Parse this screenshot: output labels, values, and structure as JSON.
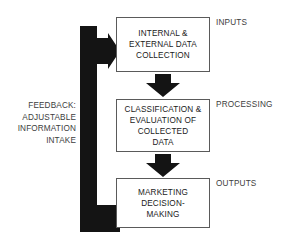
{
  "diagram": {
    "title_present": false,
    "colors": {
      "ink": "#1a1a1a",
      "label": "#3d3d3d",
      "box_border": "#5a5a5a",
      "arrow_fill": "#141414",
      "background": "#ffffff"
    },
    "boxes": [
      {
        "id": "inputs",
        "text": "INTERNAL &\nEXTERNAL DATA\nCOLLECTION",
        "stage_label": "INPUTS"
      },
      {
        "id": "processing",
        "text": "CLASSIFICATION &\nEVALUATION OF\nCOLLECTED\nDATA",
        "stage_label": "PROCESSING"
      },
      {
        "id": "outputs",
        "text": "MARKETING\nDECISION-\nMAKING",
        "stage_label": "OUTPUTS"
      }
    ],
    "feedback": {
      "text": "FEEDBACK:\nADJUSTABLE\nINFORMATION\nINTAKE"
    },
    "connectors": [
      {
        "id": "inputs-to-processing",
        "icon": "down-block-arrow-icon"
      },
      {
        "id": "processing-to-outputs",
        "icon": "down-block-arrow-icon"
      },
      {
        "id": "outputs-to-inputs-feedback",
        "icon": "feedback-loop-arrow-icon"
      }
    ]
  }
}
